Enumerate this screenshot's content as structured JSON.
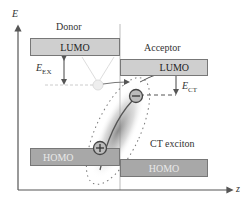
{
  "axes": {
    "y_label": "E",
    "x_label": "z"
  },
  "donor": {
    "title": "Donor",
    "lumo": "LUMO",
    "homo": "HOMO"
  },
  "acceptor": {
    "title": "Acceptor",
    "lumo": "LUMO",
    "homo": "HOMO"
  },
  "energies": {
    "ex": {
      "symbol": "E",
      "sub": "EX"
    },
    "ct": {
      "symbol": "E",
      "sub": "CT"
    }
  },
  "exciton_label": "CT exciton",
  "charges": {
    "electron": "−",
    "hole": "+"
  },
  "colors": {
    "lumo_fill": "#cfcfcf",
    "homo_fill": "#a8a8a8",
    "axis": "#555555",
    "line": "#666666"
  }
}
